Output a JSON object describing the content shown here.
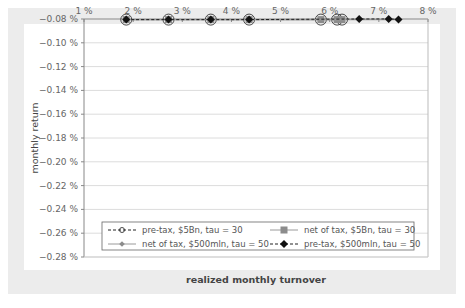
{
  "chart_data": {
    "type": "line",
    "title": "",
    "xlabel": "realized monthly turnover",
    "ylabel": "monthly return",
    "xlim": [
      0.01,
      0.08
    ],
    "ylim": [
      -0.0028,
      -0.0008
    ],
    "x_tick_labels": [
      "1 %",
      "2 %",
      "3 %",
      "4 %",
      "5 %",
      "6 %",
      "7 %",
      "8 %"
    ],
    "x_axis_position": "top",
    "y_tick_labels": [
      "-0.08 %",
      "-0.10 %",
      "-0.12 %",
      "-0.14 %",
      "-0.16 %",
      "-0.18 %",
      "-0.20 %",
      "-0.22 %",
      "-0.24 %",
      "-0.26 %",
      "-0.28 %"
    ],
    "grid": "horizontal",
    "legend_position": "inside-bottom",
    "series": [
      {
        "name": "pre-tax, $5Bn, tau = 30",
        "marker": "open-circle",
        "line": "dashed",
        "color": "#222222",
        "x": [
          1.86,
          2.72,
          3.58,
          4.36,
          5.82,
          6.15,
          6.25
        ],
        "y": [
          -0.202,
          -0.176,
          -0.166,
          -0.158,
          -0.156,
          -0.16,
          -0.159
        ]
      },
      {
        "name": "net of tax, $5Bn, tau = 30",
        "marker": "square",
        "line": "solid",
        "color": "#8c8c8c",
        "x": [
          1.86,
          2.72,
          3.58,
          4.36,
          5.82,
          6.15,
          6.25
        ],
        "y": [
          -0.215,
          -0.197,
          -0.195,
          -0.193,
          -0.202,
          -0.207,
          -0.207
        ]
      },
      {
        "name": "net of tax, $500mln, tau = 50",
        "marker": "small-diamond",
        "line": "solid",
        "color": "#8c8c8c",
        "x": [
          1.86,
          2.72,
          3.58,
          4.36,
          6.6,
          7.2,
          7.4
        ],
        "y": [
          -0.174,
          -0.148,
          -0.138,
          -0.132,
          -0.139,
          -0.139,
          -0.146
        ]
      },
      {
        "name": "pre-tax, $500mln, tau = 50",
        "marker": "filled-diamond",
        "line": "dashed",
        "color": "#111111",
        "x": [
          1.86,
          2.72,
          3.58,
          4.36,
          6.6,
          7.2,
          7.4
        ],
        "y": [
          -0.161,
          -0.125,
          -0.106,
          -0.093,
          -0.08,
          -0.08,
          -0.086
        ]
      }
    ]
  },
  "legend": {
    "items": [
      {
        "label": "pre-tax, $5Bn, tau = 30"
      },
      {
        "label": "net of tax, $5Bn, tau = 30"
      },
      {
        "label": "net of tax, $500mln, tau = 50"
      },
      {
        "label": "pre-tax, $500mln, tau = 50"
      }
    ]
  },
  "axes": {
    "xlabel": "realized monthly turnover",
    "ylabel": "monthly return"
  }
}
